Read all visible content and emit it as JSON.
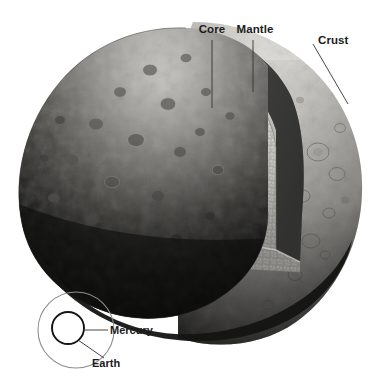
{
  "figure": {
    "background_color": "#ffffff",
    "labels": {
      "core": "Core",
      "mantle": "Mantle",
      "crust": "Crust"
    },
    "scale_comparison": {
      "outer_label": "Earth",
      "inner_label": "Mercury"
    },
    "colors": {
      "core": "#5a5a5a",
      "core_shadow": "#3c3c3c",
      "mantle": "#b9b7b1",
      "mantle_dark": "#6f6d68",
      "crust_lit": "#d8d6d0",
      "crust_mid": "#8a8882",
      "crust_shadow": "#1a1a18",
      "wedge_dark": "#121211",
      "cut_face": "#4e4e4c",
      "label_text": "#1b1b1b",
      "leader_line": "#33332f",
      "earth_circle": "#8d8d8a",
      "mercury_circle": "#151515"
    }
  }
}
